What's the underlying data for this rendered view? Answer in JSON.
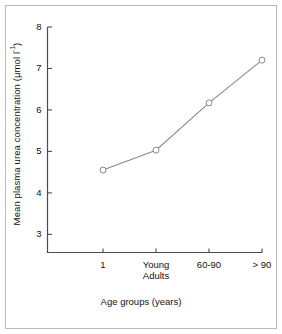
{
  "chart_data": {
    "type": "line",
    "title": "",
    "subtitle": "",
    "xlabel": "Age groups (years)",
    "ylabel": "Mean plasma urea concentration (μmol l",
    "ylabel_superscript": "-1",
    "ylabel_suffix": ")",
    "ylabel_full": "Mean plasma urea concentration (μmol l⁻¹)",
    "categories": [
      "1",
      "Young Adults",
      "60-90",
      "> 90"
    ],
    "category_lines": [
      [
        "1"
      ],
      [
        "Young",
        "Adults"
      ],
      [
        "60-90"
      ],
      [
        "> 90"
      ]
    ],
    "values": [
      4.55,
      5.03,
      6.17,
      7.2
    ],
    "series": [
      {
        "name": "Mean plasma urea concentration",
        "values": [
          4.55,
          5.03,
          6.17,
          7.2
        ],
        "marker": "open-circle",
        "line_color": "#8a8a8a",
        "marker_edge_color": "#8a8a8a",
        "marker_face_color": "#ffffff"
      }
    ],
    "ylim": [
      2.55,
      8.0
    ],
    "yticks": [
      3,
      4,
      5,
      6,
      7,
      8
    ],
    "ytick_labels": [
      "3",
      "4",
      "5",
      "6",
      "7",
      "8"
    ],
    "grid": false,
    "legend": false,
    "legend_position": "none",
    "axis_color": "#4d4d4d",
    "background_color": "#ffffff",
    "frame_border_color": "#b9b9b9"
  }
}
